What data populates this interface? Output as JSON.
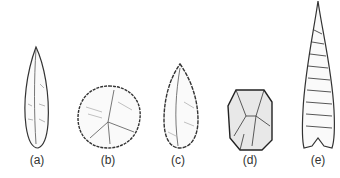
{
  "figure": {
    "items": [
      {
        "label": "(a)",
        "name": "blade"
      },
      {
        "label": "(b)",
        "name": "scraper"
      },
      {
        "label": "(c)",
        "name": "point"
      },
      {
        "label": "(d)",
        "name": "core"
      },
      {
        "label": "(e)",
        "name": "spear-point"
      }
    ]
  }
}
